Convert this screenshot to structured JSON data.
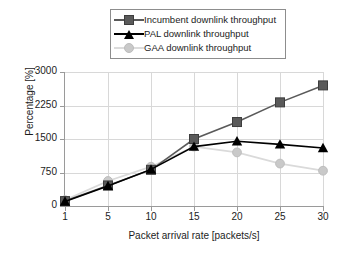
{
  "legend": {
    "position": "top-center",
    "entries": [
      {
        "label": "Incumbent downlink throughput",
        "marker": "square-icon",
        "color": "#5a5a5a"
      },
      {
        "label": "PAL downlink throughput",
        "marker": "triangle-icon",
        "color": "#000000"
      },
      {
        "label": "GAA downlink throughput",
        "marker": "circle-icon",
        "color": "#c9c9c9"
      }
    ]
  },
  "chart_data": {
    "type": "line",
    "title": "",
    "xlabel": "Packet arrival rate [packets/s]",
    "ylabel": "Percentage [%]",
    "categories": [
      1,
      5,
      10,
      15,
      20,
      25,
      30
    ],
    "xtick_labels": [
      "1",
      "5",
      "10",
      "15",
      "20",
      "25",
      "30"
    ],
    "ytick_labels": [
      "0",
      "750",
      "1500",
      "2250",
      "3000"
    ],
    "ytick_values": [
      0,
      750,
      1500,
      2250,
      3000
    ],
    "ylim": [
      0,
      3000
    ],
    "grid": true,
    "series": [
      {
        "name": "Incumbent downlink throughput",
        "marker": "square",
        "color": "#5a5a5a",
        "values": [
          110,
          460,
          810,
          1500,
          1880,
          2320,
          2700
        ]
      },
      {
        "name": "PAL downlink throughput",
        "marker": "triangle",
        "color": "#000000",
        "values": [
          100,
          450,
          820,
          1330,
          1450,
          1380,
          1300
        ]
      },
      {
        "name": "GAA downlink throughput",
        "marker": "circle",
        "color": "#c9c9c9",
        "values": [
          130,
          560,
          880,
          1330,
          1200,
          950,
          790
        ]
      }
    ]
  }
}
